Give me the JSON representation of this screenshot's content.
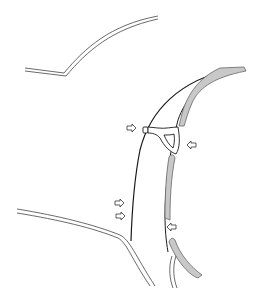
{
  "diagram": {
    "type": "technical-line-illustration",
    "colors": {
      "background": "#ffffff",
      "line": "#1a1a1a",
      "seal_fill": "#c8c8c8",
      "seal_stroke": "#555555",
      "arrow_stroke": "#333333"
    },
    "arrows": [
      {
        "id": "arrow-1",
        "x": 131,
        "y": 128,
        "direction": "right"
      },
      {
        "id": "arrow-2",
        "x": 191,
        "y": 145,
        "direction": "left"
      },
      {
        "id": "arrow-3",
        "x": 119,
        "y": 203,
        "direction": "right"
      },
      {
        "id": "arrow-4",
        "x": 120,
        "y": 216,
        "direction": "right"
      },
      {
        "id": "arrow-5",
        "x": 172,
        "y": 227,
        "direction": "left"
      }
    ]
  }
}
